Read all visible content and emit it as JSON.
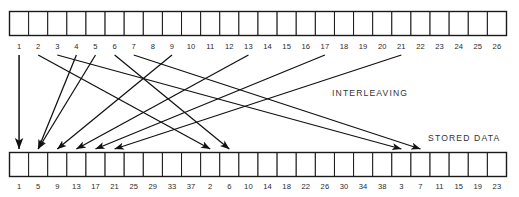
{
  "figure": {
    "background_color": "#ffffff",
    "line_color": "#111111",
    "text_color": "#333333"
  },
  "annotations": {
    "interleaving_label": "INTERLEAVING",
    "stored_data_label": "STORED DATA"
  },
  "top_row": {
    "name": "source-symbol-row",
    "cell_count": 26,
    "labels": [
      "1",
      "2",
      "3",
      "4",
      "5",
      "6",
      "7",
      "8",
      "9",
      "10",
      "11",
      "12",
      "13",
      "14",
      "15",
      "16",
      "17",
      "18",
      "19",
      "20",
      "21",
      "22",
      "23",
      "24",
      "25",
      "26"
    ]
  },
  "bottom_row": {
    "name": "stored-data-row",
    "cell_count": 26,
    "labels": [
      "1",
      "5",
      "9",
      "13",
      "17",
      "21",
      "25",
      "29",
      "33",
      "37",
      "2",
      "6",
      "10",
      "14",
      "18",
      "22",
      "26",
      "30",
      "34",
      "38",
      "3",
      "7",
      "11",
      "15",
      "19",
      "23"
    ]
  },
  "mappings": [
    {
      "from_label": "1",
      "to_label": "1",
      "from_index": 1,
      "to_index": 1
    },
    {
      "from_label": "2",
      "to_label": "2",
      "from_index": 2,
      "to_index": 11
    },
    {
      "from_label": "3",
      "to_label": "3",
      "from_index": 3,
      "to_index": 21
    },
    {
      "from_label": "4",
      "to_label": "4",
      "from_index": 4,
      "to_index": 2
    },
    {
      "from_label": "5",
      "to_label": "5",
      "from_index": 5,
      "to_index": 2
    },
    {
      "from_label": "6",
      "to_label": "6",
      "from_index": 6,
      "to_index": 12
    },
    {
      "from_label": "7",
      "to_label": "7",
      "from_index": 7,
      "to_index": 22
    },
    {
      "from_label": "9",
      "to_label": "9",
      "from_index": 9,
      "to_index": 3
    },
    {
      "from_label": "13",
      "to_label": "13",
      "from_index": 13,
      "to_index": 4
    },
    {
      "from_label": "17",
      "to_label": "17",
      "from_index": 17,
      "to_index": 5
    },
    {
      "from_label": "21",
      "to_label": "21",
      "from_index": 21,
      "to_index": 6
    }
  ],
  "chart_data": {
    "type": "diagram",
    "title": "Interleaving",
    "input_sequence": [
      1,
      2,
      3,
      4,
      5,
      6,
      7,
      8,
      9,
      10,
      11,
      12,
      13,
      14,
      15,
      16,
      17,
      18,
      19,
      20,
      21,
      22,
      23,
      24,
      25,
      26
    ],
    "output_sequence": [
      1,
      5,
      9,
      13,
      17,
      21,
      25,
      29,
      33,
      37,
      2,
      6,
      10,
      14,
      18,
      22,
      26,
      30,
      34,
      38,
      3,
      7,
      11,
      15,
      19,
      23
    ],
    "interleave_depth": 4,
    "arrow_count": 11
  }
}
